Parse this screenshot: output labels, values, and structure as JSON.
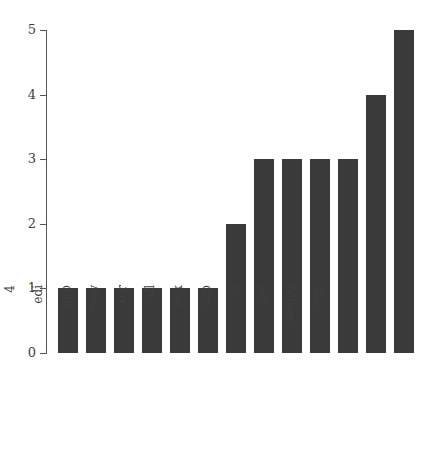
{
  "chart_data": {
    "type": "bar",
    "title": "",
    "subtitle": "",
    "xlabel": "",
    "ylabel": "",
    "categories": [
      "0x100161b",
      "4",
      "edi",
      "jmp",
      "mov",
      "xor",
      "call",
      "eax",
      "ebp",
      "je",
      "jne",
      "dword",
      "cmp"
    ],
    "values": [
      1,
      1,
      1,
      1,
      1,
      1,
      2,
      3,
      3,
      3,
      3,
      4,
      5
    ],
    "ylim": [
      0,
      5
    ],
    "yticks": [
      "0",
      "1",
      "2",
      "3",
      "4",
      "5"
    ],
    "grid": false,
    "legend": false,
    "legend_position": "none",
    "bar_color": "#3a3a3a",
    "axis_color": "#555555",
    "background_color": "#ffffff",
    "tick_label_rotation": 90
  }
}
